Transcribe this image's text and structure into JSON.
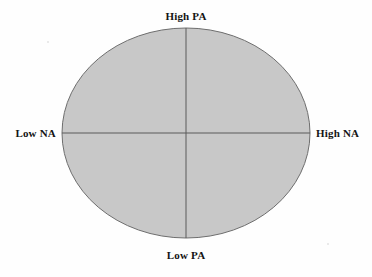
{
  "figure": {
    "type": "quadrant-diagram",
    "background_color": "#fefefe",
    "shape": {
      "name": "ellipse",
      "center_x": 186,
      "center_y": 133,
      "radius_x": 124,
      "radius_y": 105,
      "fill_color": "#c8c8c8",
      "stroke_color": "#6e6e6e",
      "stroke_width": 1
    },
    "axes": {
      "stroke_color": "#5a5a5a",
      "stroke_width": 1,
      "vertical_x": 186,
      "horizontal_y": 133
    },
    "labels": {
      "top": "High PA",
      "bottom": "Low PA",
      "left": "Low NA",
      "right": "High NA"
    }
  },
  "chart_data": {
    "type": "scatter",
    "title": "",
    "subtitle": "",
    "xlabel": "NA",
    "ylabel": "PA",
    "xlim": [
      -1,
      1
    ],
    "ylim": [
      -1,
      1
    ],
    "grid": false,
    "legend": "none",
    "x_axis_tick_labels": [
      "Low NA",
      "High NA"
    ],
    "y_axis_tick_labels": [
      "Low PA",
      "High PA"
    ],
    "annotations": [
      {
        "text": "High PA",
        "position": "top",
        "x": 0,
        "y": 1
      },
      {
        "text": "Low PA",
        "position": "bottom",
        "x": 0,
        "y": -1
      },
      {
        "text": "Low NA",
        "position": "left",
        "x": -1,
        "y": 0
      },
      {
        "text": "High NA",
        "position": "right",
        "x": 1,
        "y": 0
      }
    ],
    "series": [],
    "values": [],
    "categories": []
  }
}
